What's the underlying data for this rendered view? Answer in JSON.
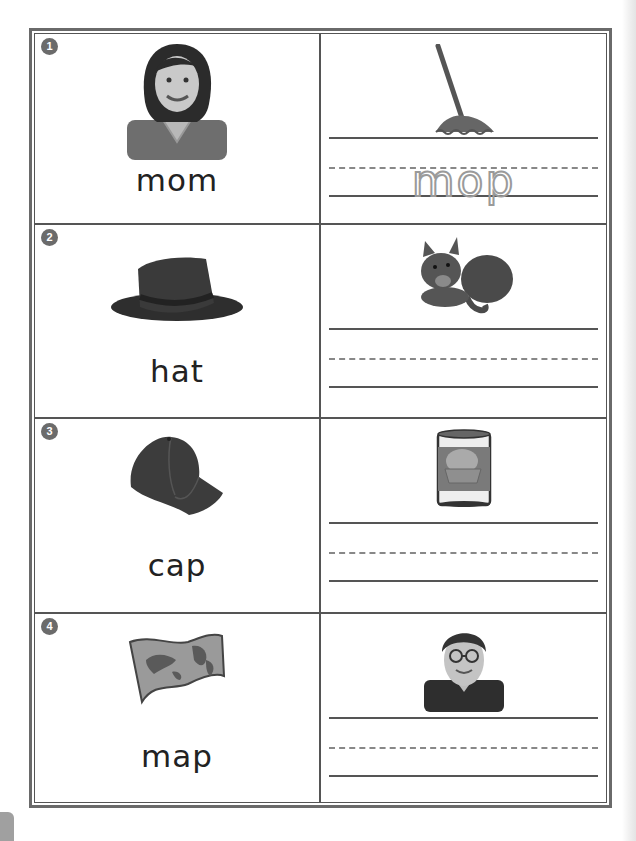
{
  "worksheet": {
    "rows": [
      {
        "number": "1",
        "left": {
          "picture": "woman-portrait",
          "word": "mom"
        },
        "right": {
          "picture": "mop",
          "trace_word": "mop"
        }
      },
      {
        "number": "2",
        "left": {
          "picture": "fedora-hat",
          "word": "hat"
        },
        "right": {
          "picture": "cat",
          "trace_word": ""
        }
      },
      {
        "number": "3",
        "left": {
          "picture": "baseball-cap",
          "word": "cap"
        },
        "right": {
          "picture": "can",
          "trace_word": ""
        }
      },
      {
        "number": "4",
        "left": {
          "picture": "world-map",
          "word": "map"
        },
        "right": {
          "picture": "man-with-glasses",
          "trace_word": ""
        }
      }
    ]
  },
  "colors": {
    "border": "#555555",
    "badge": "#6b6b6b",
    "trace": "#9a9a9a"
  }
}
